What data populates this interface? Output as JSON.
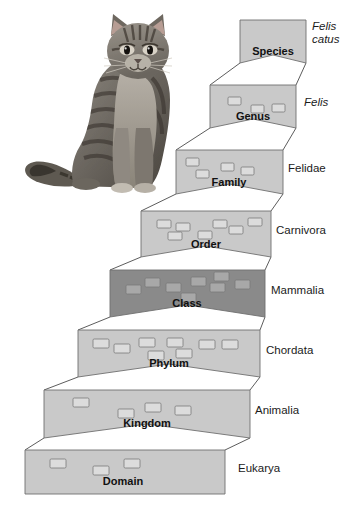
{
  "figure": {
    "subject_photo": "tabby-cat-grayscale"
  },
  "colors": {
    "box_fill_light": "#c9c9c9",
    "box_fill_dark": "#8a8a8a",
    "box_stroke": "#6f6f6f",
    "glyph_fill_light": "#dcdcdc",
    "glyph_fill_dark": "#a8a8a8",
    "glyph_stroke": "#7a7a7a",
    "connector": "#4a4a4a",
    "rank_text": "#111111",
    "taxon_text": "#1b1b1b",
    "background": "#ffffff"
  },
  "levels": [
    {
      "rank": "Species",
      "taxon": "Felis catus",
      "taxon_italic": true,
      "taxon_multiline": [
        "Felis",
        "catus"
      ],
      "shade": "light",
      "organism_count": 0,
      "box": {
        "x": 240,
        "y": 20,
        "w": 66,
        "h": 43,
        "notch": 8
      },
      "rank_label_pos": {
        "x": 273,
        "y": 55
      },
      "taxon_label_pos": {
        "x": 312,
        "y": 30
      }
    },
    {
      "rank": "Genus",
      "taxon": "Felis",
      "taxon_italic": true,
      "taxon_multiline": [
        "Felis"
      ],
      "shade": "light",
      "organism_count": 3,
      "box": {
        "x": 210,
        "y": 85,
        "w": 86,
        "h": 43,
        "notch": 9
      },
      "rank_label_pos": {
        "x": 253,
        "y": 120
      },
      "taxon_label_pos": {
        "x": 304,
        "y": 106
      },
      "glyphs": [
        {
          "x": 228,
          "y": 97,
          "w": 13,
          "h": 8
        },
        {
          "x": 251,
          "y": 105,
          "w": 13,
          "h": 8
        },
        {
          "x": 272,
          "y": 104,
          "w": 13,
          "h": 8
        }
      ]
    },
    {
      "rank": "Family",
      "taxon": "Felidae",
      "taxon_italic": false,
      "shade": "light",
      "organism_count": 4,
      "box": {
        "x": 176,
        "y": 150,
        "w": 107,
        "h": 44,
        "notch": 10
      },
      "rank_label_pos": {
        "x": 229,
        "y": 186
      },
      "taxon_label_pos": {
        "x": 288,
        "y": 172
      },
      "glyphs": [
        {
          "x": 186,
          "y": 158,
          "w": 13,
          "h": 8
        },
        {
          "x": 196,
          "y": 170,
          "w": 13,
          "h": 8
        },
        {
          "x": 221,
          "y": 163,
          "w": 13,
          "h": 8
        },
        {
          "x": 241,
          "y": 167,
          "w": 13,
          "h": 8
        }
      ]
    },
    {
      "rank": "Order",
      "taxon": "Carnivora",
      "taxon_italic": false,
      "shade": "light",
      "organism_count": 7,
      "box": {
        "x": 141,
        "y": 211,
        "w": 130,
        "h": 46,
        "notch": 11
      },
      "rank_label_pos": {
        "x": 206,
        "y": 248
      },
      "taxon_label_pos": {
        "x": 276,
        "y": 234
      },
      "glyphs": [
        {
          "x": 157,
          "y": 220,
          "w": 14,
          "h": 8
        },
        {
          "x": 176,
          "y": 223,
          "w": 14,
          "h": 8
        },
        {
          "x": 168,
          "y": 232,
          "w": 14,
          "h": 8
        },
        {
          "x": 198,
          "y": 231,
          "w": 14,
          "h": 8
        },
        {
          "x": 213,
          "y": 220,
          "w": 14,
          "h": 8
        },
        {
          "x": 229,
          "y": 226,
          "w": 14,
          "h": 8
        },
        {
          "x": 248,
          "y": 218,
          "w": 14,
          "h": 8
        }
      ]
    },
    {
      "rank": "Class",
      "taxon": "Mammalia",
      "taxon_italic": false,
      "shade": "dark",
      "organism_count": 8,
      "box": {
        "x": 110,
        "y": 270,
        "w": 155,
        "h": 47,
        "notch": 12
      },
      "rank_label_pos": {
        "x": 187,
        "y": 307
      },
      "taxon_label_pos": {
        "x": 271,
        "y": 294
      },
      "glyphs": [
        {
          "x": 126,
          "y": 285,
          "w": 15,
          "h": 9
        },
        {
          "x": 145,
          "y": 278,
          "w": 15,
          "h": 9
        },
        {
          "x": 166,
          "y": 283,
          "w": 15,
          "h": 9
        },
        {
          "x": 181,
          "y": 293,
          "w": 15,
          "h": 9
        },
        {
          "x": 191,
          "y": 277,
          "w": 15,
          "h": 9
        },
        {
          "x": 210,
          "y": 283,
          "w": 15,
          "h": 9
        },
        {
          "x": 214,
          "y": 272,
          "w": 15,
          "h": 9
        },
        {
          "x": 235,
          "y": 280,
          "w": 15,
          "h": 9
        }
      ]
    },
    {
      "rank": "Phylum",
      "taxon": "Chordata",
      "taxon_italic": false,
      "shade": "light",
      "organism_count": 8,
      "box": {
        "x": 78,
        "y": 330,
        "w": 182,
        "h": 47,
        "notch": 13
      },
      "rank_label_pos": {
        "x": 169,
        "y": 367
      },
      "taxon_label_pos": {
        "x": 266,
        "y": 354
      },
      "glyphs": [
        {
          "x": 93,
          "y": 339,
          "w": 16,
          "h": 9
        },
        {
          "x": 114,
          "y": 344,
          "w": 16,
          "h": 9
        },
        {
          "x": 139,
          "y": 338,
          "w": 16,
          "h": 9
        },
        {
          "x": 148,
          "y": 351,
          "w": 16,
          "h": 9
        },
        {
          "x": 167,
          "y": 338,
          "w": 16,
          "h": 9
        },
        {
          "x": 176,
          "y": 349,
          "w": 16,
          "h": 9
        },
        {
          "x": 199,
          "y": 340,
          "w": 16,
          "h": 9
        },
        {
          "x": 222,
          "y": 340,
          "w": 16,
          "h": 9
        }
      ]
    },
    {
      "rank": "Kingdom",
      "taxon": "Animalia",
      "taxon_italic": false,
      "shade": "light",
      "organism_count": 4,
      "box": {
        "x": 44,
        "y": 390,
        "w": 206,
        "h": 48,
        "notch": 14
      },
      "rank_label_pos": {
        "x": 147,
        "y": 427
      },
      "taxon_label_pos": {
        "x": 255,
        "y": 414
      },
      "glyphs": [
        {
          "x": 73,
          "y": 398,
          "w": 16,
          "h": 9
        },
        {
          "x": 118,
          "y": 409,
          "w": 16,
          "h": 9
        },
        {
          "x": 145,
          "y": 403,
          "w": 16,
          "h": 9
        },
        {
          "x": 175,
          "y": 406,
          "w": 16,
          "h": 9
        }
      ]
    },
    {
      "rank": "Domain",
      "taxon": "Eukarya",
      "taxon_italic": false,
      "shade": "light",
      "organism_count": 3,
      "box": {
        "x": 25,
        "y": 450,
        "w": 200,
        "h": 44,
        "notch": 0
      },
      "rank_label_pos": {
        "x": 123,
        "y": 485
      },
      "taxon_label_pos": {
        "x": 238,
        "y": 472
      },
      "glyphs": [
        {
          "x": 50,
          "y": 459,
          "w": 16,
          "h": 9
        },
        {
          "x": 93,
          "y": 466,
          "w": 16,
          "h": 9
        },
        {
          "x": 124,
          "y": 459,
          "w": 16,
          "h": 9
        }
      ]
    }
  ]
}
